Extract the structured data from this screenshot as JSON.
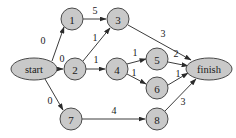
{
  "figure": {
    "type": "directed-weighted-graph",
    "background_color": "#ffffff",
    "node_fill_color": "#c9c9c9",
    "node_stroke_color": "#4a4a4a",
    "edge_color": "#3c3c3c",
    "text_color": "#1a1a1a"
  },
  "nodes": [
    {
      "id": "start",
      "label": "start",
      "shape": "ellipse",
      "cx": 34,
      "cy": 69,
      "rx": 23,
      "ry": 11
    },
    {
      "id": "1",
      "label": "1",
      "shape": "circle",
      "cx": 72,
      "cy": 19,
      "r": 11
    },
    {
      "id": "3",
      "label": "3",
      "shape": "circle",
      "cx": 118,
      "cy": 19,
      "r": 11
    },
    {
      "id": "2",
      "label": "2",
      "shape": "circle",
      "cx": 75,
      "cy": 69,
      "r": 11
    },
    {
      "id": "4",
      "label": "4",
      "shape": "circle",
      "cx": 117,
      "cy": 69,
      "r": 11
    },
    {
      "id": "5",
      "label": "5",
      "shape": "circle",
      "cx": 157,
      "cy": 59,
      "r": 11
    },
    {
      "id": "6",
      "label": "6",
      "shape": "circle",
      "cx": 157,
      "cy": 88,
      "r": 11
    },
    {
      "id": "7",
      "label": "7",
      "shape": "circle",
      "cx": 71,
      "cy": 119,
      "r": 11
    },
    {
      "id": "8",
      "label": "8",
      "shape": "circle",
      "cx": 157,
      "cy": 119,
      "r": 11
    },
    {
      "id": "finish",
      "label": "finish",
      "shape": "ellipse",
      "cx": 209,
      "cy": 69,
      "rx": 23,
      "ry": 11
    }
  ],
  "edges": [
    {
      "from": "start",
      "to": "1",
      "weight": "0",
      "x1": 52,
      "y1": 61,
      "x2": 64,
      "y2": 27,
      "lx": 43,
      "ly": 40
    },
    {
      "from": "start",
      "to": "2",
      "weight": "0",
      "x1": 57,
      "y1": 69,
      "x2": 63,
      "y2": 69,
      "lx": 62,
      "ly": 58
    },
    {
      "from": "start",
      "to": "7",
      "weight": "0",
      "x1": 45,
      "y1": 79,
      "x2": 63,
      "y2": 110,
      "lx": 50,
      "ly": 100
    },
    {
      "from": "1",
      "to": "3",
      "weight": "5",
      "x1": 83,
      "y1": 19,
      "x2": 106,
      "y2": 19,
      "lx": 95,
      "ly": 10
    },
    {
      "from": "2",
      "to": "3",
      "weight": "1",
      "x1": 83,
      "y1": 61,
      "x2": 110,
      "y2": 28,
      "lx": 95,
      "ly": 37
    },
    {
      "from": "2",
      "to": "4",
      "weight": "1",
      "x1": 86,
      "y1": 69,
      "x2": 105,
      "y2": 69,
      "lx": 96,
      "ly": 59
    },
    {
      "from": "3",
      "to": "finish",
      "weight": "3",
      "x1": 128,
      "y1": 25,
      "x2": 191,
      "y2": 60,
      "lx": 163,
      "ly": 33
    },
    {
      "from": "4",
      "to": "5",
      "weight": "1",
      "x1": 127,
      "y1": 64,
      "x2": 146,
      "y2": 59,
      "lx": 135,
      "ly": 52
    },
    {
      "from": "4",
      "to": "6",
      "weight": "1",
      "x1": 127,
      "y1": 74,
      "x2": 146,
      "y2": 84,
      "lx": 134,
      "ly": 72
    },
    {
      "from": "5",
      "to": "finish",
      "weight": "2",
      "x1": 168,
      "y1": 62,
      "x2": 188,
      "y2": 66,
      "lx": 176,
      "ly": 53
    },
    {
      "from": "6",
      "to": "finish",
      "weight": "1",
      "x1": 168,
      "y1": 85,
      "x2": 188,
      "y2": 73,
      "lx": 178,
      "ly": 73
    },
    {
      "from": "7",
      "to": "8",
      "weight": "4",
      "x1": 82,
      "y1": 119,
      "x2": 145,
      "y2": 119,
      "lx": 114,
      "ly": 110
    },
    {
      "from": "8",
      "to": "finish",
      "weight": "3",
      "x1": 165,
      "y1": 111,
      "x2": 196,
      "y2": 79,
      "lx": 183,
      "ly": 101
    }
  ]
}
